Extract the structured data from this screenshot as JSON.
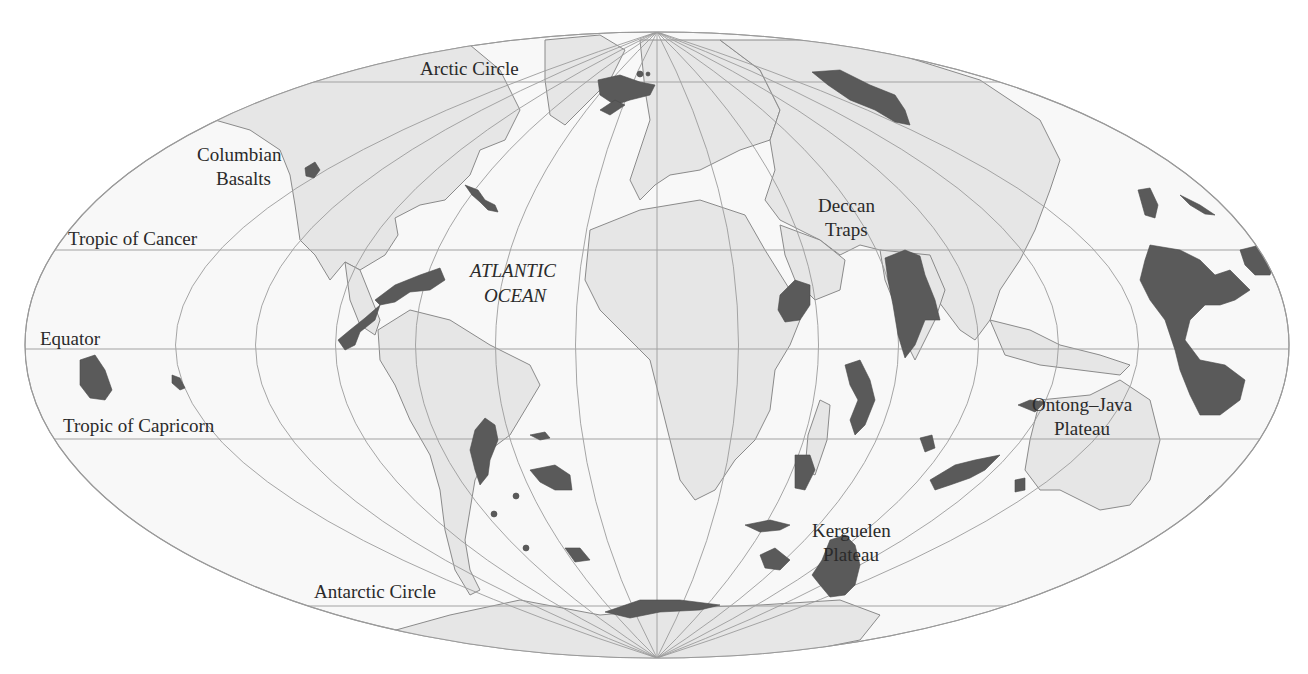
{
  "map": {
    "projection": "mollweide-like world map",
    "colors": {
      "ocean": "#f8f8f8",
      "land": "#e6e6e6",
      "coastline": "#8a8a8a",
      "large_igneous_province": "#5a5a5a",
      "graticule": "#9c9c9c",
      "label_text": "#2a2a2a"
    },
    "parallels": [
      {
        "name": "Arctic Circle",
        "label": "Arctic Circle"
      },
      {
        "name": "Tropic of Cancer",
        "label": "Tropic of Cancer"
      },
      {
        "name": "Equator",
        "label": "Equator"
      },
      {
        "name": "Tropic of Capricorn",
        "label": "Tropic of Capricorn"
      },
      {
        "name": "Antarctic Circle",
        "label": "Antarctic Circle"
      }
    ],
    "ocean_label": {
      "line1": "ATLANTIC",
      "line2": "OCEAN"
    },
    "provinces": [
      {
        "id": "columbian",
        "line1": "Columbian",
        "line2": "Basalts"
      },
      {
        "id": "deccan",
        "line1": "Deccan",
        "line2": "Traps"
      },
      {
        "id": "ontong",
        "line1": "Ontong–Java",
        "line2": "Plateau"
      },
      {
        "id": "kerguelen",
        "line1": "Kerguelen",
        "line2": "Plateau"
      }
    ]
  }
}
